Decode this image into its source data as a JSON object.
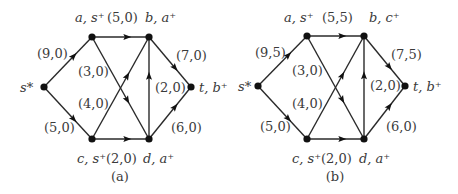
{
  "figure": {
    "panels": [
      {
        "id": "a",
        "caption": "(a)",
        "nodes": [
          {
            "id": "s",
            "x": 44,
            "y": 87,
            "label": "s*",
            "lx": 20,
            "ly": 92,
            "anchor": "start"
          },
          {
            "id": "a",
            "x": 92,
            "y": 37,
            "label": "a, s⁺",
            "lx": 75,
            "ly": 22,
            "anchor": "start"
          },
          {
            "id": "b",
            "x": 149,
            "y": 37,
            "label": "b, a⁺",
            "lx": 145,
            "ly": 22,
            "anchor": "start"
          },
          {
            "id": "t",
            "x": 191,
            "y": 87,
            "label": "t, b⁺",
            "lx": 199,
            "ly": 92,
            "anchor": "start"
          },
          {
            "id": "c",
            "x": 92,
            "y": 139,
            "label": "c, s⁺",
            "lx": 77,
            "ly": 163,
            "anchor": "start"
          },
          {
            "id": "d",
            "x": 149,
            "y": 139,
            "label": "d, a⁺",
            "lx": 143,
            "ly": 163,
            "anchor": "start"
          }
        ],
        "edges": [
          {
            "from": "s",
            "to": "a",
            "label": "(9,0)",
            "lx": 37,
            "ly": 58
          },
          {
            "from": "a",
            "to": "b",
            "label": "(5,0)",
            "lx": 107,
            "ly": 22
          },
          {
            "from": "a",
            "to": "d",
            "label": "(3,0)",
            "lx": 78,
            "ly": 76
          },
          {
            "from": "c",
            "to": "b",
            "label": "(4,0)",
            "lx": 78,
            "ly": 108
          },
          {
            "from": "s",
            "to": "c",
            "label": "(5,0)",
            "lx": 44,
            "ly": 132
          },
          {
            "from": "b",
            "to": "t",
            "label": "(7,0)",
            "lx": 176,
            "ly": 60
          },
          {
            "from": "d",
            "to": "b",
            "label": "(2,0)",
            "lx": 155,
            "ly": 92
          },
          {
            "from": "d",
            "to": "t",
            "label": "(6,0)",
            "lx": 171,
            "ly": 132
          },
          {
            "from": "c",
            "to": "d",
            "label": "(2,0)",
            "lx": 106,
            "ly": 163
          }
        ],
        "caption_x": 120,
        "caption_y": 181
      },
      {
        "id": "b",
        "caption": "(b)",
        "nodes": [
          {
            "id": "s",
            "x": 258,
            "y": 86,
            "label": "s*",
            "lx": 238,
            "ly": 91,
            "anchor": "start"
          },
          {
            "id": "a",
            "x": 307,
            "y": 36,
            "label": "a, s⁺",
            "lx": 284,
            "ly": 22,
            "anchor": "start"
          },
          {
            "id": "b",
            "x": 364,
            "y": 36,
            "label": "b, c⁺",
            "lx": 369,
            "ly": 22,
            "anchor": "start"
          },
          {
            "id": "t",
            "x": 405,
            "y": 86,
            "label": "t, b⁺",
            "lx": 413,
            "ly": 91,
            "anchor": "start"
          },
          {
            "id": "c",
            "x": 307,
            "y": 139,
            "label": "c, s⁺",
            "lx": 292,
            "ly": 163,
            "anchor": "start"
          },
          {
            "id": "d",
            "x": 364,
            "y": 139,
            "label": "d, a⁺",
            "lx": 359,
            "ly": 163,
            "anchor": "start"
          }
        ],
        "edges": [
          {
            "from": "s",
            "to": "a",
            "label": "(9,5)",
            "lx": 255,
            "ly": 57
          },
          {
            "from": "a",
            "to": "b",
            "label": "(5,5)",
            "lx": 322,
            "ly": 22
          },
          {
            "from": "a",
            "to": "d",
            "label": "(3,0)",
            "lx": 292,
            "ly": 75
          },
          {
            "from": "c",
            "to": "b",
            "label": "(4,0)",
            "lx": 292,
            "ly": 108
          },
          {
            "from": "s",
            "to": "c",
            "label": "(5,0)",
            "lx": 260,
            "ly": 131
          },
          {
            "from": "b",
            "to": "t",
            "label": "(7,5)",
            "lx": 391,
            "ly": 59
          },
          {
            "from": "d",
            "to": "b",
            "label": "(2,0)",
            "lx": 370,
            "ly": 90
          },
          {
            "from": "d",
            "to": "t",
            "label": "(6,0)",
            "lx": 386,
            "ly": 131
          },
          {
            "from": "c",
            "to": "d",
            "label": "(2,0)",
            "lx": 321,
            "ly": 163
          }
        ],
        "caption_x": 335,
        "caption_y": 181
      }
    ]
  }
}
